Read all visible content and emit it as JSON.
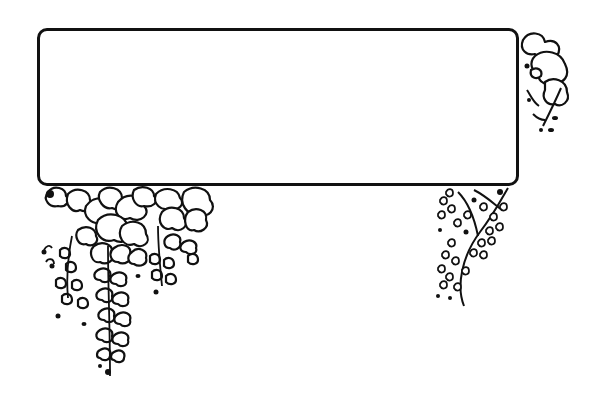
{
  "illustration": {
    "subject": "decorative rectangular frame with hanging wisteria flowers",
    "style": "black ink line art on white",
    "colors": {
      "ink": "#111111",
      "background": "#ffffff"
    },
    "frame": {
      "shape": "rounded-rectangle",
      "content_text": "",
      "x": 37,
      "y": 28,
      "width": 479,
      "height": 155,
      "corner_radius": 10,
      "stroke_width": 3
    },
    "decorations": [
      {
        "name": "wisteria-cluster-bottom-left",
        "position": "below frame, left",
        "icon": "wisteria-flower-icon"
      },
      {
        "name": "wisteria-raceme-bottom-right",
        "position": "below frame, right",
        "icon": "wisteria-raceme-icon"
      },
      {
        "name": "wisteria-cluster-top-right",
        "position": "right of frame, top",
        "icon": "wisteria-flower-icon"
      }
    ]
  }
}
